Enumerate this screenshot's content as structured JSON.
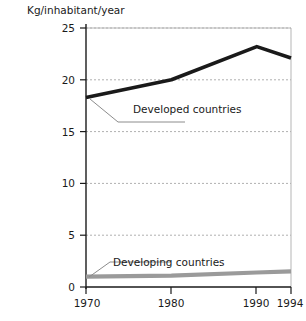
{
  "chart_data": {
    "type": "line",
    "title": "Kg/inhabitant/year",
    "xlabel": "",
    "ylabel": "",
    "ylim": [
      0,
      25
    ],
    "xlim": [
      1970,
      1994
    ],
    "grid": true,
    "legend_position": "inline-annotations",
    "x": [
      1970,
      1980,
      1990,
      1994
    ],
    "xticks": [
      "1970",
      "1980",
      "1990",
      "1994"
    ],
    "yticks": [
      "0",
      "5",
      "10",
      "15",
      "20",
      "25"
    ],
    "ytick_values": [
      0,
      5,
      10,
      15,
      20,
      25
    ],
    "series": [
      {
        "name": "Developed countries",
        "color": "#1a1a1a",
        "values": [
          18.3,
          20.0,
          23.2,
          22.1
        ]
      },
      {
        "name": "Developing countries",
        "color": "#9a9a9a",
        "values": [
          1.0,
          1.1,
          1.4,
          1.5
        ]
      }
    ],
    "annotations": [
      {
        "text": "Developed countries",
        "series": "Developed countries"
      },
      {
        "text": "Developing countries",
        "series": "Developing countries"
      }
    ]
  },
  "colors": {
    "background": "#ffffff",
    "axis": "#1a1a1a",
    "frame": "#b5b5b5",
    "grid": "#b0b0b0",
    "developed_line": "#1a1a1a",
    "developing_line": "#9a9a9a",
    "leader": "#808080",
    "text": "#1a1a1a"
  }
}
